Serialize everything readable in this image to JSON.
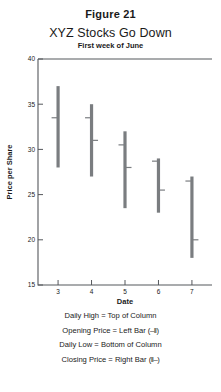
{
  "figure_label": "Figure 21",
  "chart_data": {
    "type": "bar",
    "title": "XYZ Stocks Go Down",
    "subtitle": "First week of June",
    "xlabel": "Date",
    "ylabel": "Price per Share",
    "xlim": [
      2.4,
      7.6
    ],
    "ylim": [
      15,
      40
    ],
    "xticks": [
      3,
      4,
      5,
      6,
      7
    ],
    "yticks": [
      40,
      35,
      30,
      25,
      20,
      15
    ],
    "xtick_labels": [
      "3",
      "4",
      "5",
      "6",
      "7"
    ],
    "ytick_labels": [
      "40",
      "35",
      "30",
      "25",
      "20",
      "15"
    ],
    "grid": false,
    "legend_position": "below-plot",
    "categories": [
      "3",
      "4",
      "5",
      "6",
      "7"
    ],
    "series": [
      {
        "name": "Daily High",
        "values": [
          37.0,
          35.0,
          32.0,
          29.0,
          27.0
        ]
      },
      {
        "name": "Opening Price",
        "values": [
          33.5,
          33.5,
          30.5,
          28.7,
          26.5
        ]
      },
      {
        "name": "Closing Price",
        "values": [
          null,
          31.0,
          28.0,
          25.5,
          20.0
        ]
      },
      {
        "name": "Daily Low",
        "values": [
          28.0,
          27.0,
          23.5,
          23.0,
          18.0
        ]
      }
    ],
    "points": [
      {
        "date": "3",
        "high": 37.0,
        "open": 33.5,
        "close": null,
        "low": 28.0
      },
      {
        "date": "4",
        "high": 35.0,
        "open": 33.5,
        "close": 31.0,
        "low": 27.0
      },
      {
        "date": "5",
        "high": 32.0,
        "open": 30.5,
        "close": 28.0,
        "low": 23.5
      },
      {
        "date": "6",
        "high": 29.0,
        "open": 28.7,
        "close": 25.5,
        "low": 23.0
      },
      {
        "date": "7",
        "high": 27.0,
        "open": 26.5,
        "close": 20.0,
        "low": 18.0
      }
    ],
    "annotations": [
      {
        "text": "Daily High = Top of Column",
        "glyph": ""
      },
      {
        "text": "Opening Price = Left Bar",
        "glyph": "(–‖)"
      },
      {
        "text": "Daily Low = Bottom of Column",
        "glyph": ""
      },
      {
        "text": "Closing Price = Right Bar",
        "glyph": "(‖–)"
      }
    ],
    "colors": {
      "bar": "#7a7d80",
      "axis": "#55585c",
      "background": "#ffffff",
      "text": "#1a1a1a"
    }
  },
  "legend": {
    "lines": [
      {
        "label": "Daily High = Top of Column",
        "symbol": ""
      },
      {
        "label": "Opening Price = Left Bar ",
        "symbol": "(–‖)"
      },
      {
        "label": "Daily Low = Bottom of Column",
        "symbol": ""
      },
      {
        "label": "Closing Price = Right Bar ",
        "symbol": "(‖–)"
      }
    ]
  }
}
